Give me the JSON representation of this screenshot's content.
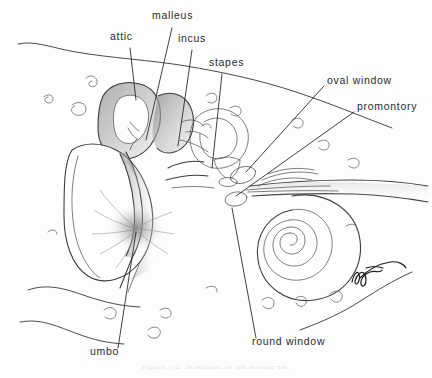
{
  "figure": {
    "title": "Schematic of the middle ear",
    "medium": "pencil drawing",
    "background_color": "#fdfdfd",
    "ink_color": "#2b2b2b",
    "caption": "Figure 1-2.  Schematic of the middle ear."
  },
  "labels": [
    {
      "id": "attic",
      "text": "attic",
      "x": 110,
      "y": 40
    },
    {
      "id": "malleus",
      "text": "malleus",
      "x": 152,
      "y": 19
    },
    {
      "id": "incus",
      "text": "incus",
      "x": 178,
      "y": 42
    },
    {
      "id": "stapes",
      "text": "stapes",
      "x": 209,
      "y": 66
    },
    {
      "id": "oval-window",
      "text": "oval  window",
      "x": 327,
      "y": 84
    },
    {
      "id": "promontory",
      "text": "promontory",
      "x": 357,
      "y": 110
    },
    {
      "id": "round-window",
      "text": "round  window",
      "x": 252,
      "y": 345
    },
    {
      "id": "umbo",
      "text": "umbo",
      "x": 90,
      "y": 355
    }
  ],
  "structures": [
    {
      "id": "tympanic-membrane",
      "name": "tympanic membrane"
    },
    {
      "id": "mastoid-attic",
      "name": "attic / mastoid bone"
    },
    {
      "id": "ossicular-chain",
      "name": "ossicular chain"
    },
    {
      "id": "cochlea",
      "name": "cochlea"
    },
    {
      "id": "ear-canal",
      "name": "external auditory canal"
    }
  ],
  "signature": {
    "present": true,
    "description": "artist signature, cursive"
  }
}
